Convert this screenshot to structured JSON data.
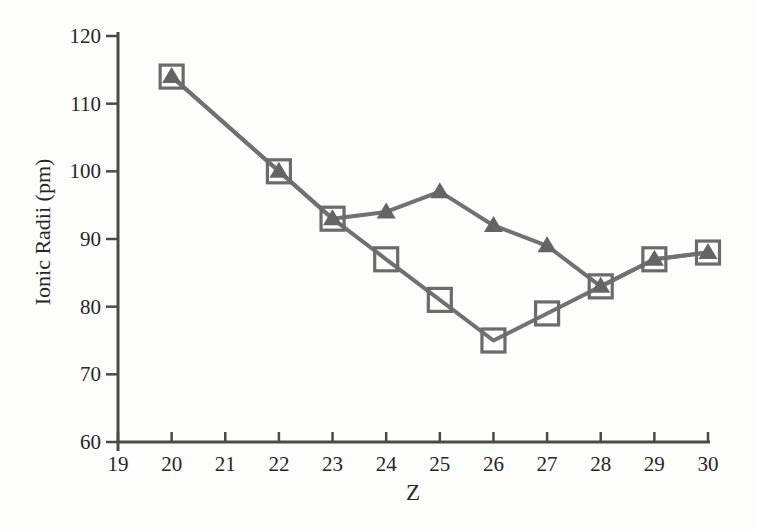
{
  "figure": {
    "background": "#fdfdfc",
    "title": ""
  },
  "chart_data": {
    "type": "line",
    "title": "",
    "xlabel": "Z",
    "ylabel": "Ionic Radii (pm)",
    "xlim": [
      19,
      30
    ],
    "ylim": [
      60,
      120
    ],
    "x_ticks": [
      19,
      20,
      21,
      22,
      23,
      24,
      25,
      26,
      27,
      28,
      29,
      30
    ],
    "y_ticks": [
      60,
      70,
      80,
      90,
      100,
      110,
      120
    ],
    "grid": false,
    "legend": "none",
    "x": [
      20,
      22,
      23,
      24,
      25,
      26,
      27,
      28,
      29,
      30
    ],
    "series": [
      {
        "name": "high-spin ions (filled triangles)",
        "marker": "triangle",
        "values": [
          114,
          100,
          93,
          94,
          97,
          92,
          89,
          83,
          87,
          88
        ]
      },
      {
        "name": "low-spin ions (open squares)",
        "marker": "square",
        "values": [
          114,
          100,
          93,
          87,
          81,
          75,
          79,
          83,
          87,
          88
        ]
      }
    ],
    "colors": {
      "line": "#717174",
      "marker_fill": "#646467",
      "marker_stroke": "#6b6b6e",
      "axis": "#4a4a4a",
      "text": "#262626"
    }
  }
}
